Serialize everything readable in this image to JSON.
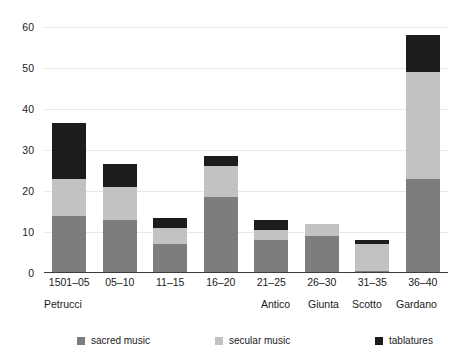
{
  "chart_data": {
    "type": "bar",
    "subtype": "stacked-bar",
    "title": "",
    "subtitle": "",
    "xlabel": "",
    "ylabel": "",
    "ylim": [
      0,
      60
    ],
    "yticks": [
      0,
      10,
      20,
      30,
      40,
      50,
      60
    ],
    "ytick_labels": [
      "0",
      "10",
      "20",
      "30",
      "40",
      "50",
      "60"
    ],
    "grid": true,
    "grid_axis": "y",
    "legend_position": "bottom",
    "categories": [
      "1501–05",
      "05–10",
      "11–15",
      "16–20",
      "21–25",
      "26–30",
      "31–35",
      "36–40"
    ],
    "group_labels": [
      "Petrucci",
      "Antico",
      "Giunta",
      "Scotto",
      "Gardano"
    ],
    "series": [
      {
        "name": "sacred music",
        "color": "#7d7d7d",
        "values": [
          14,
          13,
          7,
          18.5,
          8,
          9,
          0.5,
          23
        ]
      },
      {
        "name": "secular music",
        "color": "#c2c2c2",
        "values": [
          9,
          8,
          4,
          7.5,
          2.5,
          3,
          6.5,
          26
        ]
      },
      {
        "name": "tablatures",
        "color": "#1c1c1c",
        "values": [
          13.5,
          5.5,
          2.5,
          2.5,
          2.5,
          0,
          1,
          9
        ]
      }
    ],
    "totals": [
      36.5,
      26.5,
      13.5,
      28.5,
      13,
      12,
      8,
      58
    ]
  },
  "axes": {
    "y_tick_labels": [
      "60",
      "50",
      "40",
      "30",
      "20",
      "10",
      "0"
    ]
  },
  "xaxis": {
    "labels": [
      "1501–05",
      "05–10",
      "11–15",
      "16–20",
      "21–25",
      "26–30",
      "31–35",
      "36–40"
    ]
  },
  "publishers": {
    "items": [
      {
        "name": "Petrucci",
        "left": 44
      },
      {
        "name": "Antico",
        "left": 261
      },
      {
        "name": "Giunta",
        "left": 308
      },
      {
        "name": "Scotto",
        "left": 352
      },
      {
        "name": "Gardano",
        "left": 396
      }
    ]
  },
  "legend": {
    "items": [
      {
        "label": "sacred music",
        "color": "#7d7d7d",
        "left": 77
      },
      {
        "label": "secular music",
        "color": "#c2c2c2",
        "left": 215
      },
      {
        "label": "tablatures",
        "color": "#1c1c1c",
        "left": 375
      }
    ]
  },
  "colors": {
    "sacred": "#7d7d7d",
    "secular": "#c2c2c2",
    "tablatures": "#1c1c1c",
    "axis": "#3c3c3c",
    "grid": "#e8e8e8",
    "background": "#ffffff"
  }
}
